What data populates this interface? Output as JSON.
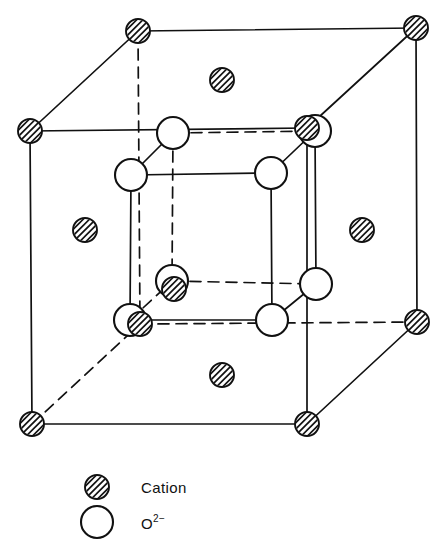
{
  "figure": {
    "title": "",
    "width": 447,
    "height": 556,
    "background_color": "#ffffff",
    "line_color": "#111111",
    "atom_fill_color": "#ffffff",
    "hatch_color": "#111111"
  },
  "legend": {
    "items": [
      {
        "symbol": "hatched-small-circle",
        "label": "Cation",
        "label_sup": "",
        "marker_x": 97,
        "marker_y": 487,
        "marker_r": 12,
        "text_x": 141,
        "text_y": 493
      },
      {
        "symbol": "open-large-circle",
        "label": "O",
        "label_sup": "2−",
        "marker_x": 97,
        "marker_y": 522,
        "marker_r": 16,
        "text_x": 141,
        "text_y": 529
      }
    ]
  },
  "structure": {
    "outer_cell": {
      "name": "cation-cube",
      "species": "Cation",
      "marker_r": 12,
      "vertices": [
        {
          "id": "top-front-left",
          "x": 30,
          "y": 131
        },
        {
          "id": "top-back-left",
          "x": 138,
          "y": 31
        },
        {
          "id": "top-back-right",
          "x": 416,
          "y": 28
        },
        {
          "id": "top-front-right",
          "x": 307,
          "y": 128
        },
        {
          "id": "bot-front-left",
          "x": 32,
          "y": 424
        },
        {
          "id": "bot-back-left",
          "x": 140,
          "y": 324
        },
        {
          "id": "bot-back-right",
          "x": 417,
          "y": 322
        },
        {
          "id": "bot-front-right",
          "x": 307,
          "y": 424
        }
      ],
      "face_centers": [
        {
          "id": "face-top",
          "x": 222,
          "y": 80
        },
        {
          "id": "face-bottom",
          "x": 222,
          "y": 375
        },
        {
          "id": "face-left",
          "x": 85,
          "y": 230
        },
        {
          "id": "face-right",
          "x": 362,
          "y": 230
        }
      ],
      "solid_edges": [
        [
          "top-front-left",
          "top-back-left"
        ],
        [
          "top-back-left",
          "top-back-right"
        ],
        [
          "top-back-right",
          "top-front-right"
        ],
        [
          "top-front-left",
          "top-front-right"
        ],
        [
          "top-front-left",
          "bot-front-left"
        ],
        [
          "top-back-right",
          "bot-back-right"
        ],
        [
          "top-front-right",
          "bot-front-right"
        ],
        [
          "bot-front-left",
          "bot-front-right"
        ],
        [
          "bot-back-right",
          "bot-front-right"
        ]
      ],
      "dashed_edges": [
        [
          "top-back-left",
          "bot-back-left"
        ],
        [
          "bot-back-left",
          "bot-back-right"
        ],
        [
          "bot-front-left",
          "bot-back-left"
        ]
      ]
    },
    "inner_cell": {
      "name": "oxygen-cube",
      "species": "O2-",
      "marker_r": 16,
      "vertices": [
        {
          "id": "o-top-front-left",
          "x": 131,
          "y": 175
        },
        {
          "id": "o-top-back-left",
          "x": 173,
          "y": 133
        },
        {
          "id": "o-top-back-right",
          "x": 315,
          "y": 131
        },
        {
          "id": "o-top-front-right",
          "x": 271,
          "y": 173
        },
        {
          "id": "o-bot-front-left",
          "x": 130,
          "y": 320
        },
        {
          "id": "o-bot-back-left",
          "x": 172,
          "y": 281
        },
        {
          "id": "o-bot-back-right",
          "x": 316,
          "y": 284
        },
        {
          "id": "o-bot-front-right",
          "x": 272,
          "y": 320
        }
      ],
      "solid_edges": [
        [
          "o-top-front-left",
          "o-top-front-right"
        ],
        [
          "o-top-front-left",
          "o-bot-front-left"
        ],
        [
          "o-top-front-right",
          "o-bot-front-right"
        ],
        [
          "o-bot-front-left",
          "o-bot-front-right"
        ],
        [
          "o-top-front-left",
          "o-top-back-left"
        ],
        [
          "o-top-front-right",
          "o-top-back-right"
        ],
        [
          "o-bot-front-right",
          "o-bot-back-right"
        ],
        [
          "o-top-back-right",
          "o-bot-back-right"
        ]
      ],
      "dashed_edges": [
        [
          "o-top-back-left",
          "o-top-back-right"
        ],
        [
          "o-top-back-left",
          "o-bot-back-left"
        ],
        [
          "o-bot-back-left",
          "o-bot-back-right"
        ],
        [
          "o-bot-front-left",
          "o-bot-back-left"
        ]
      ]
    },
    "body_center": {
      "id": "body-center-cation",
      "species": "Cation",
      "x": 174,
      "y": 289,
      "marker_r": 12
    }
  }
}
